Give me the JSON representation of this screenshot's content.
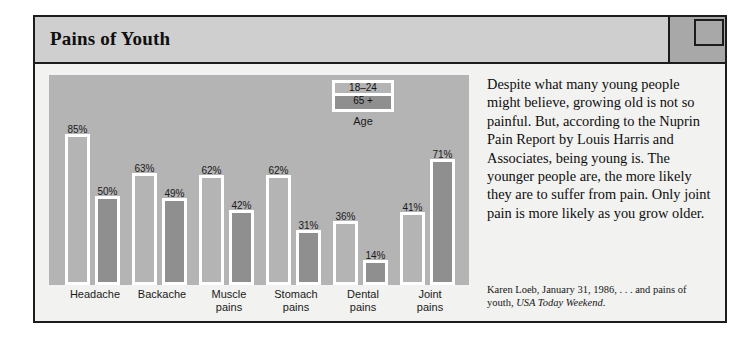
{
  "figure": {
    "title": "Pains of Youth"
  },
  "chart_data": {
    "type": "bar",
    "title": "Pains of Youth",
    "xlabel": "",
    "ylabel": "",
    "ylim": [
      0,
      100
    ],
    "grid": false,
    "legend_position": "inside-top-center",
    "legend_title": "Age",
    "categories": [
      "Headache",
      "Backache",
      "Muscle pains",
      "Stomach pains",
      "Dental pains",
      "Joint pains"
    ],
    "category_lines": [
      [
        "Headache"
      ],
      [
        "Backache"
      ],
      [
        "Muscle",
        "pains"
      ],
      [
        "Stomach",
        "pains"
      ],
      [
        "Dental",
        "pains"
      ],
      [
        "Joint",
        "pains"
      ]
    ],
    "series": [
      {
        "name": "18–24",
        "color": "#b4b4b4",
        "values": [
          85,
          63,
          62,
          62,
          36,
          41
        ],
        "labels": [
          "85%",
          "63%",
          "62%",
          "62%",
          "36%",
          "41%"
        ]
      },
      {
        "name": "65 +",
        "color": "#8f8f8f",
        "values": [
          50,
          49,
          42,
          31,
          14,
          71
        ],
        "labels": [
          "50%",
          "49%",
          "42%",
          "31%",
          "14%",
          "71%"
        ]
      }
    ]
  },
  "sidebar": {
    "blurb": "Despite what many young people might believe, growing old is not so painful. But, according to the Nuprin Pain Report by Louis Harris and Associates, being young is. The younger people are, the more likely they are to suffer from pain. Only joint pain is more likely as you grow older.",
    "credit_main": "Karen Loeb, January 31, 1986, . . . and pains of youth, ",
    "credit_italic": "USA Today Weekend",
    "credit_end": "."
  },
  "colors": {
    "panel": "#b4b4b4",
    "bar_young": "#b4b4b4",
    "bar_old": "#8f8f8f",
    "bar_outline": "#ffffff",
    "title_band": "#cfcfcf",
    "corner_block": "#a8a8a8",
    "frame": "#1c1c1c",
    "page": "#f2f2f0"
  }
}
